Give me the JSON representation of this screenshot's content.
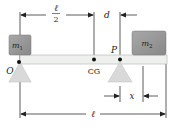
{
  "diagram": {
    "type": "lever / beam balance",
    "labels": {
      "half_length_num": "ℓ",
      "half_length_den": "2",
      "distance_d": "d",
      "mass1": "m",
      "mass1_sub": "1",
      "mass2": "m",
      "mass2_sub": "2",
      "pivot_o": "O",
      "center_of_gravity": "CG",
      "pivot_p": "P",
      "distance_x": "x",
      "length": "ℓ"
    },
    "colors": {
      "beam_fill": "#eef0ee",
      "beam_stroke": "#b8bcb8",
      "block_fill": "#8f8f8f",
      "block_fill_light": "#a4a4a4",
      "support_fill": "#d9d9d9",
      "line": "#333333",
      "dot": "#111111"
    }
  }
}
